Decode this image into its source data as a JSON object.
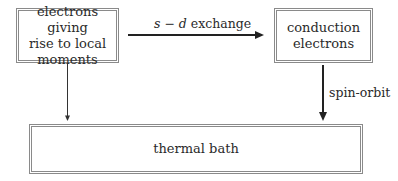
{
  "diagram": {
    "nodes": {
      "local_moments": {
        "lines": [
          "electrons giving",
          "rise to local",
          "moments"
        ]
      },
      "conduction": {
        "lines": [
          "conduction",
          "electrons"
        ]
      },
      "thermal_bath": {
        "label": "thermal bath"
      }
    },
    "edges": {
      "sd_exchange": {
        "label_s": "s",
        "label_op": " − ",
        "label_d": "d",
        "label_rest": " exchange",
        "from": "local_moments",
        "to": "conduction"
      },
      "spin_orbit": {
        "label": "spin-orbit",
        "from": "conduction",
        "to": "thermal_bath"
      },
      "local_to_bath": {
        "label": "",
        "from": "local_moments",
        "to": "thermal_bath"
      }
    },
    "colors": {
      "box_border": "#8a8a8a",
      "arrow": "#222222",
      "text": "#2a2a2a"
    }
  }
}
